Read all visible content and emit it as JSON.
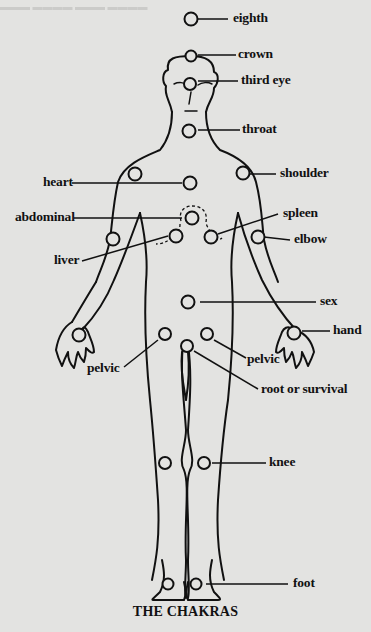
{
  "figure": {
    "caption": "THE CHAKRAS",
    "header_fragment": "... ... ...",
    "labels": {
      "eighth": "eighth",
      "crown": "crown",
      "third_eye": "third eye",
      "throat": "throat",
      "shoulder": "shoulder",
      "heart": "heart",
      "abdominal": "abdominal",
      "spleen": "spleen",
      "elbow": "elbow",
      "liver": "liver",
      "sex": "sex",
      "hand": "hand",
      "pelvic_left": "pelvic",
      "pelvic_right": "pelvic",
      "root": "root or survival",
      "knee": "knee",
      "foot": "foot"
    }
  }
}
